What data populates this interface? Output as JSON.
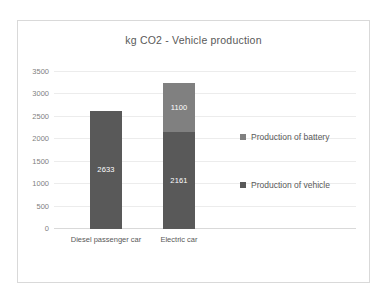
{
  "chart_data": {
    "type": "bar",
    "subtype": "stacked-column",
    "title": "kg CO2 - Vehicle production",
    "xlabel": "",
    "ylabel": "",
    "categories": [
      "Diesel passenger car",
      "Electric car"
    ],
    "series": [
      {
        "name": "Production of vehicle",
        "values": [
          2633,
          2161
        ],
        "color": "#595959",
        "labels": [
          "2633",
          "2161"
        ]
      },
      {
        "name": "Production of battery",
        "values": [
          0,
          1100
        ],
        "color": "#808080",
        "labels": [
          "",
          "1100"
        ]
      }
    ],
    "totals": [
      2633,
      3261
    ],
    "ylim": [
      0,
      3500
    ],
    "yticks": [
      0,
      500,
      1000,
      1500,
      2000,
      2500,
      3000,
      3500
    ],
    "ytick_labels": [
      "0",
      "500",
      "1000",
      "1500",
      "2000",
      "2500",
      "3000",
      "3500"
    ],
    "grid": true,
    "grid_axis": "y",
    "legend_position": "right",
    "legend_order": [
      "Production of battery",
      "Production of vehicle"
    ]
  },
  "legend": {
    "items": [
      {
        "label": "Production of battery",
        "color": "#808080",
        "marker": "square-marker"
      },
      {
        "label": "Production of vehicle",
        "color": "#595959",
        "marker": "square-marker"
      }
    ]
  }
}
